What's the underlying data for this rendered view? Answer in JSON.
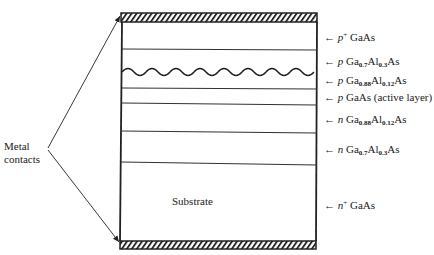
{
  "diagram": {
    "title_annotation": {
      "line1": "Metal",
      "line2": "contacts"
    },
    "substrate_label": "Substrate",
    "arrow_glyph": "←",
    "layers": [
      {
        "type": "p",
        "sup": "+",
        "material": "GaAs",
        "parts": []
      },
      {
        "type": "p",
        "sup": "",
        "material": "",
        "parts": [
          [
            "Ga",
            "0.7"
          ],
          [
            "Al",
            "0.3"
          ],
          [
            "As",
            ""
          ]
        ]
      },
      {
        "type": "p",
        "sup": "",
        "material": "",
        "parts": [
          [
            "Ga",
            "0.88"
          ],
          [
            "Al",
            "0.12"
          ],
          [
            "As",
            ""
          ]
        ]
      },
      {
        "type": "p",
        "sup": "",
        "material": "GaAs (active layer)",
        "parts": []
      },
      {
        "type": "n",
        "sup": "",
        "material": "",
        "parts": [
          [
            "Ga",
            "0.88"
          ],
          [
            "Al",
            "0.12"
          ],
          [
            "As",
            ""
          ]
        ]
      },
      {
        "type": "n",
        "sup": "",
        "material": "",
        "parts": [
          [
            "Ga",
            "0.7"
          ],
          [
            "Al",
            "0.3"
          ],
          [
            "As",
            ""
          ]
        ]
      },
      {
        "type": "n",
        "sup": "+",
        "material": "GaAs",
        "parts": []
      }
    ]
  }
}
